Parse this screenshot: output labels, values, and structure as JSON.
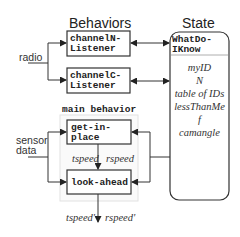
{
  "titles": {
    "behaviors": "Behaviors",
    "state": "State"
  },
  "inputs": {
    "radio": "radio",
    "sensor_line1": "sensor",
    "sensor_line2": "data"
  },
  "behaviors": {
    "channelN": {
      "line1": "channelN-",
      "line2": "Listener"
    },
    "channelC": {
      "line1": "channelC-",
      "line2": "Listener"
    },
    "main_label": "main behavior",
    "get_in_place": {
      "line1": "get-in-",
      "line2": "place"
    },
    "look_ahead": "look-ahead"
  },
  "state": {
    "header_line1": "WhatDo-",
    "header_line2": "IKnow",
    "items": [
      "myID",
      "N",
      "table of IDs",
      "lessThanMe",
      "f",
      "camangle"
    ]
  },
  "signals": {
    "inner_t": "tspeed",
    "inner_r": "rspeed",
    "out_t": "tspeed'",
    "out_r": "rspeed'"
  }
}
